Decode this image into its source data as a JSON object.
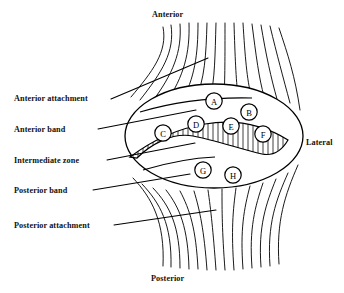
{
  "figure": {
    "orientation_labels": {
      "anterior": "Anterior",
      "posterior": "Posterior",
      "lateral": "Lateral"
    },
    "structure_labels": [
      {
        "id": "anterior-attachment",
        "text": "Anterior attachment"
      },
      {
        "id": "anterior-band",
        "text": "Anterior band"
      },
      {
        "id": "intermediate-zone",
        "text": "Intermediate zone"
      },
      {
        "id": "posterior-band",
        "text": "Posterior band"
      },
      {
        "id": "posterior-attachment",
        "text": "Posterior attachment"
      }
    ],
    "reference_points": [
      {
        "label": "A",
        "cx": 214,
        "cy": 101
      },
      {
        "label": "B",
        "cx": 249,
        "cy": 112
      },
      {
        "label": "C",
        "cx": 163,
        "cy": 133
      },
      {
        "label": "D",
        "cx": 196,
        "cy": 124
      },
      {
        "label": "E",
        "cx": 231,
        "cy": 126
      },
      {
        "label": "F",
        "cx": 263,
        "cy": 134
      },
      {
        "label": "G",
        "cx": 203,
        "cy": 170
      },
      {
        "label": "H",
        "cx": 233,
        "cy": 175
      }
    ],
    "colors": {
      "ink": "#000000",
      "background": "#ffffff"
    }
  }
}
